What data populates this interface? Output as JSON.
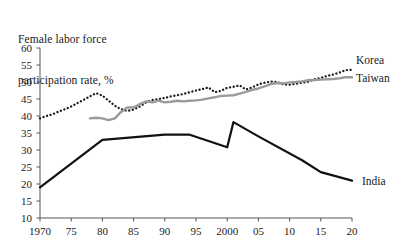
{
  "chart_data": {
    "type": "line",
    "title": "Female labor force\nparticipation rate, %",
    "title_line1": "Female labor force",
    "title_line2": "participation rate, %",
    "xlabel": "",
    "ylabel": "",
    "ylim": [
      10,
      60
    ],
    "xlim": [
      1970,
      2020
    ],
    "grid": false,
    "legend_position": "right-inline",
    "yticks": [
      60,
      55,
      50,
      45,
      40,
      35,
      30,
      25,
      20,
      15,
      10
    ],
    "ytick_labels": [
      "60",
      "55",
      "50",
      "45",
      "40",
      "35",
      "30",
      "25",
      "20",
      "15",
      "10"
    ],
    "xticks": [
      1970,
      1975,
      1980,
      1985,
      1990,
      1995,
      2000,
      2005,
      2010,
      2015,
      2020
    ],
    "xtick_labels": [
      "1970",
      "75",
      "80",
      "85",
      "90",
      "95",
      "2000",
      "05",
      "10",
      "15",
      "20"
    ],
    "series": [
      {
        "name": "Korea",
        "label": "Korea",
        "style": "dotted",
        "color": "#1a1a1a",
        "x": [
          1970,
          1971,
          1972,
          1973,
          1974,
          1975,
          1976,
          1977,
          1978,
          1979,
          1980,
          1981,
          1982,
          1983,
          1984,
          1985,
          1986,
          1987,
          1988,
          1989,
          1990,
          1991,
          1992,
          1993,
          1994,
          1995,
          1996,
          1997,
          1998,
          1999,
          2000,
          2001,
          2002,
          2003,
          2004,
          2005,
          2006,
          2007,
          2008,
          2009,
          2010,
          2011,
          2012,
          2013,
          2014,
          2015,
          2016,
          2017,
          2018,
          2019,
          2020
        ],
        "values": [
          39.3,
          40.0,
          40.5,
          41.3,
          42.0,
          42.8,
          43.8,
          44.8,
          45.8,
          46.7,
          46.0,
          44.5,
          43.0,
          42.0,
          41.5,
          41.9,
          42.8,
          44.0,
          44.7,
          45.0,
          45.3,
          45.8,
          46.1,
          46.5,
          47.0,
          47.5,
          47.9,
          48.4,
          47.0,
          47.4,
          48.3,
          48.6,
          49.0,
          47.8,
          48.4,
          49.3,
          49.8,
          50.1,
          50.0,
          49.3,
          49.2,
          49.5,
          49.8,
          50.1,
          50.8,
          51.2,
          51.8,
          52.2,
          52.8,
          53.5,
          53.6
        ]
      },
      {
        "name": "Taiwan",
        "label": "Taiwan",
        "style": "solid",
        "color": "#9a9a9a",
        "x": [
          1978,
          1979,
          1980,
          1981,
          1982,
          1983,
          1984,
          1985,
          1986,
          1987,
          1988,
          1989,
          1990,
          1991,
          1992,
          1993,
          1994,
          1995,
          1996,
          1997,
          1998,
          1999,
          2000,
          2001,
          2002,
          2003,
          2004,
          2005,
          2006,
          2007,
          2008,
          2009,
          2010,
          2011,
          2012,
          2013,
          2014,
          2015,
          2016,
          2017,
          2018,
          2019,
          2020
        ],
        "values": [
          39.3,
          39.5,
          39.3,
          38.8,
          39.3,
          41.2,
          42.5,
          42.5,
          43.5,
          44.3,
          44.0,
          44.5,
          44.0,
          44.2,
          44.5,
          44.3,
          44.5,
          44.6,
          44.8,
          45.2,
          45.5,
          45.9,
          46.0,
          46.1,
          46.6,
          47.1,
          47.7,
          48.1,
          48.7,
          49.4,
          49.7,
          49.6,
          49.9,
          50.0,
          50.2,
          50.5,
          50.6,
          50.7,
          50.8,
          50.9,
          51.1,
          51.4,
          51.4
        ]
      },
      {
        "name": "India",
        "label": "India",
        "style": "solid",
        "color": "#111111",
        "x": [
          1970,
          1980,
          1990,
          1994,
          2000,
          2001,
          2005,
          2012,
          2015,
          2020
        ],
        "values": [
          19.0,
          33.0,
          34.5,
          34.5,
          30.8,
          38.2,
          34.0,
          27.0,
          23.5,
          21.0
        ]
      }
    ],
    "annotations": []
  },
  "labels": {
    "korea": "Korea",
    "taiwan": "Taiwan",
    "india": "India"
  }
}
